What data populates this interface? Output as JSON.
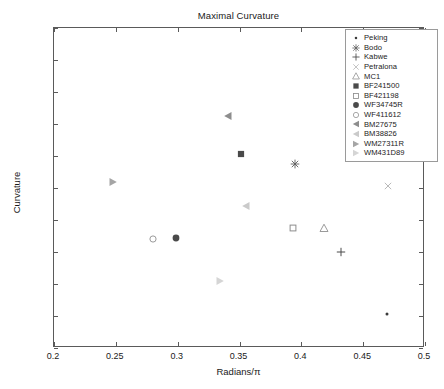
{
  "chart_data": {
    "type": "scatter",
    "title": "Maximal Curvature",
    "xlabel": "Radians/π",
    "ylabel": "Curvature",
    "xlim": [
      0.2,
      0.5
    ],
    "ylim": [
      0.01,
      0.03
    ],
    "xticks": [
      "0.2",
      "0.25",
      "0.3",
      "0.35",
      "0.4",
      "0.45",
      "0.5"
    ],
    "xtick_values": [
      0.2,
      0.25,
      0.3,
      0.35,
      0.4,
      0.45,
      0.5
    ],
    "yticks": [
      "0.01",
      "0.012",
      "0.014",
      "0.016",
      "0.018",
      "0.02",
      "0.022",
      "0.024",
      "0.026",
      "0.028",
      "0.03"
    ],
    "ytick_values": [
      0.01,
      0.012,
      0.014,
      0.016,
      0.018,
      0.02,
      0.022,
      0.024,
      0.026,
      0.028,
      0.03
    ],
    "grid": false,
    "legend_position": "top-right",
    "series": [
      {
        "name": "Peking",
        "marker": "dot",
        "color": "#3b3b3b",
        "x": [
          0.469
        ],
        "y": [
          0.0121
        ]
      },
      {
        "name": "Bodo",
        "marker": "star",
        "color": "#5b5b5b",
        "x": [
          0.395
        ],
        "y": [
          0.0215
        ]
      },
      {
        "name": "Kabwe",
        "marker": "plus",
        "color": "#4a4a4a",
        "x": [
          0.432
        ],
        "y": [
          0.016
        ]
      },
      {
        "name": "Petralona",
        "marker": "x",
        "color": "#b9b9b9",
        "x": [
          0.47
        ],
        "y": [
          0.0201
        ]
      },
      {
        "name": "MC1",
        "marker": "triangle-up",
        "color": "#9a9a9a",
        "x": [
          0.418
        ],
        "y": [
          0.0175
        ]
      },
      {
        "name": "BF241500",
        "marker": "filled-square",
        "color": "#4a4a4a",
        "x": [
          0.351
        ],
        "y": [
          0.0221
        ]
      },
      {
        "name": "BF421198",
        "marker": "open-square",
        "color": "#8d8d8d",
        "x": [
          0.393
        ],
        "y": [
          0.0175
        ]
      },
      {
        "name": "WF34745R",
        "marker": "filled-circle",
        "color": "#4a4a4a",
        "x": [
          0.299
        ],
        "y": [
          0.0169
        ]
      },
      {
        "name": "WF411612",
        "marker": "open-circle",
        "color": "#9a9a9a",
        "x": [
          0.28
        ],
        "y": [
          0.0168
        ]
      },
      {
        "name": "BM27675",
        "marker": "triangle-left",
        "color": "#8d8d8d",
        "x": [
          0.341
        ],
        "y": [
          0.0245
        ]
      },
      {
        "name": "BM38826",
        "marker": "triangle-left",
        "color": "#cacaca",
        "x": [
          0.355
        ],
        "y": [
          0.0189
        ]
      },
      {
        "name": "WM27311R",
        "marker": "triangle-right",
        "color": "#a5a5a5",
        "x": [
          0.248
        ],
        "y": [
          0.0204
        ]
      },
      {
        "name": "WM431D89",
        "marker": "triangle-right",
        "color": "#d5d5d5",
        "x": [
          0.334
        ],
        "y": [
          0.0142
        ]
      }
    ]
  },
  "legend": {
    "entries": [
      {
        "label": "Peking"
      },
      {
        "label": "Bodo"
      },
      {
        "label": "Kabwe"
      },
      {
        "label": "Petralona"
      },
      {
        "label": "MC1"
      },
      {
        "label": "BF241500"
      },
      {
        "label": "BF421198"
      },
      {
        "label": "WF34745R"
      },
      {
        "label": "WF411612"
      },
      {
        "label": "BM27675"
      },
      {
        "label": "BM38826"
      },
      {
        "label": "WM27311R"
      },
      {
        "label": "WM431D89"
      }
    ]
  },
  "colors": {
    "axis": "#5a5a5a",
    "text": "#1a1a1a",
    "background": "#ffffff",
    "legend_border": "#9a9a9a"
  }
}
